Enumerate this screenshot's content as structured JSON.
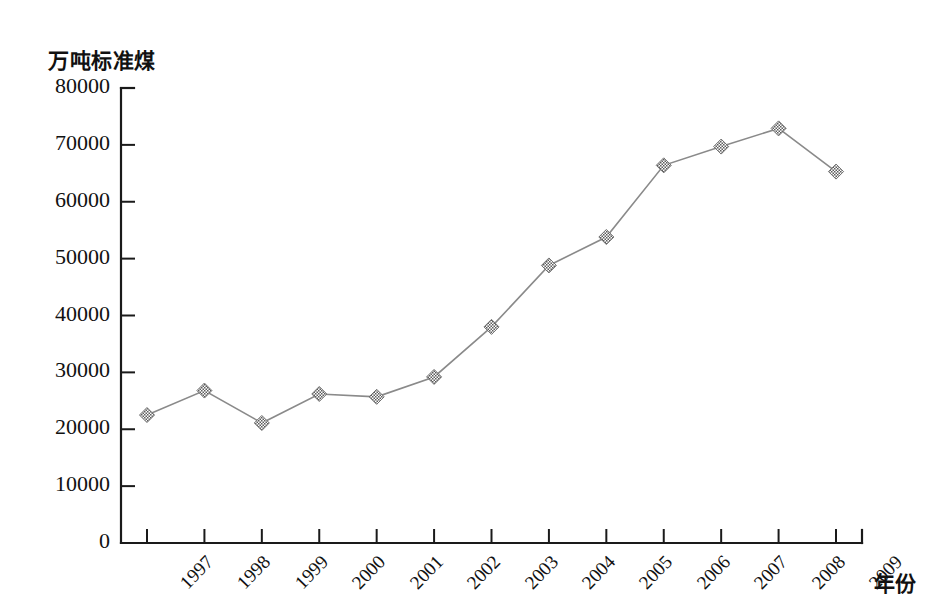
{
  "chart_data": {
    "type": "line",
    "title": "",
    "subtitle": "",
    "xlabel": "年份",
    "ylabel": "万吨标准煤",
    "categories": [
      "1997",
      "1998",
      "1999",
      "2000",
      "2001",
      "2002",
      "2003",
      "2004",
      "2005",
      "2006",
      "2007",
      "2008",
      "2009"
    ],
    "values": [
      22500,
      26800,
      21100,
      26200,
      25700,
      29200,
      38000,
      48800,
      53800,
      66400,
      69700,
      72900,
      65300
    ],
    "series": [
      {
        "name": "万吨标准煤",
        "values": [
          22500,
          26800,
          21100,
          26200,
          25700,
          29200,
          38000,
          48800,
          53800,
          66400,
          69700,
          72900,
          65300
        ]
      }
    ],
    "ylim": [
      0,
      80000
    ],
    "ytick_values": [
      0,
      10000,
      20000,
      30000,
      40000,
      50000,
      60000,
      70000,
      80000
    ],
    "ytick_labels": [
      "0",
      "10000",
      "20000",
      "30000",
      "40000",
      "50000",
      "60000",
      "70000",
      "80000"
    ],
    "grid": false,
    "legend": false,
    "legend_position": "none",
    "marker": "diamond",
    "marker_color": "#6e6e6e",
    "line_color": "#8a8a8a",
    "axis_color": "#1a1a1a",
    "background_color": "#ffffff"
  },
  "axes": {
    "y_axis_title": "万吨标准煤",
    "x_axis_title": "年份"
  }
}
